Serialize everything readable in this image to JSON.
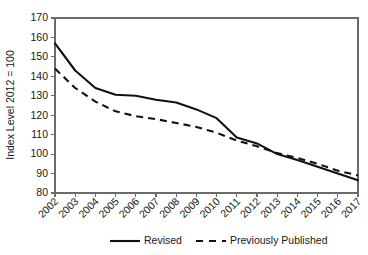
{
  "chart_data": {
    "type": "line",
    "title": "",
    "xlabel": "",
    "ylabel": "Index Level 2012 = 100",
    "categories": [
      "2002",
      "2003",
      "2004",
      "2005",
      "2006",
      "2007",
      "2008",
      "2009",
      "2010",
      "2011",
      "2012",
      "2013",
      "2014",
      "2015",
      "2016",
      "2017"
    ],
    "ylim": [
      80,
      170
    ],
    "ytick_step": 10,
    "yticks": [
      "170",
      "160",
      "150",
      "140",
      "130",
      "120",
      "110",
      "100",
      "90",
      "80"
    ],
    "grid": false,
    "legend_position": "bottom",
    "series": [
      {
        "name": "Revised",
        "style": "solid",
        "color": "#111111",
        "values": [
          157,
          143,
          134,
          130.5,
          130,
          128,
          126.5,
          123,
          118.5,
          108.5,
          105.5,
          100,
          97,
          93.5,
          90,
          86.5
        ]
      },
      {
        "name": "Previously Published",
        "style": "dashed",
        "color": "#111111",
        "values": [
          144,
          134,
          127,
          122,
          119.5,
          118,
          116,
          114,
          111,
          107,
          104,
          100.5,
          98,
          95,
          91.5,
          89
        ]
      }
    ]
  },
  "legend": {
    "items": [
      {
        "label": "Revised"
      },
      {
        "label": "Previously Published"
      }
    ]
  }
}
